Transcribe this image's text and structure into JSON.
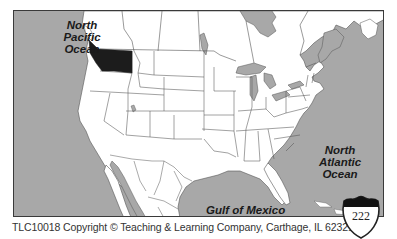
{
  "map": {
    "title": "North America outline map",
    "highlighted_region": "Washington",
    "colors": {
      "water": "#a8a8a8",
      "land": "#ffffff",
      "borders": "#555555",
      "highlight": "#1c1c1c",
      "frame": "#3a3a3a"
    },
    "labels": {
      "pacific": "North Pacific Ocean",
      "pacific_lines": [
        "North",
        "Pacific",
        "Ocean"
      ],
      "atlantic": "North Atlantic Ocean",
      "atlantic_lines": [
        "North",
        "Atlantic",
        "Ocean"
      ],
      "gulf": "Gulf of Mexico"
    }
  },
  "footer": {
    "copyright": "TLC10018 Copyright © Teaching & Learning Company, Carthage, IL  62321"
  },
  "page_badge": {
    "number": "222"
  }
}
